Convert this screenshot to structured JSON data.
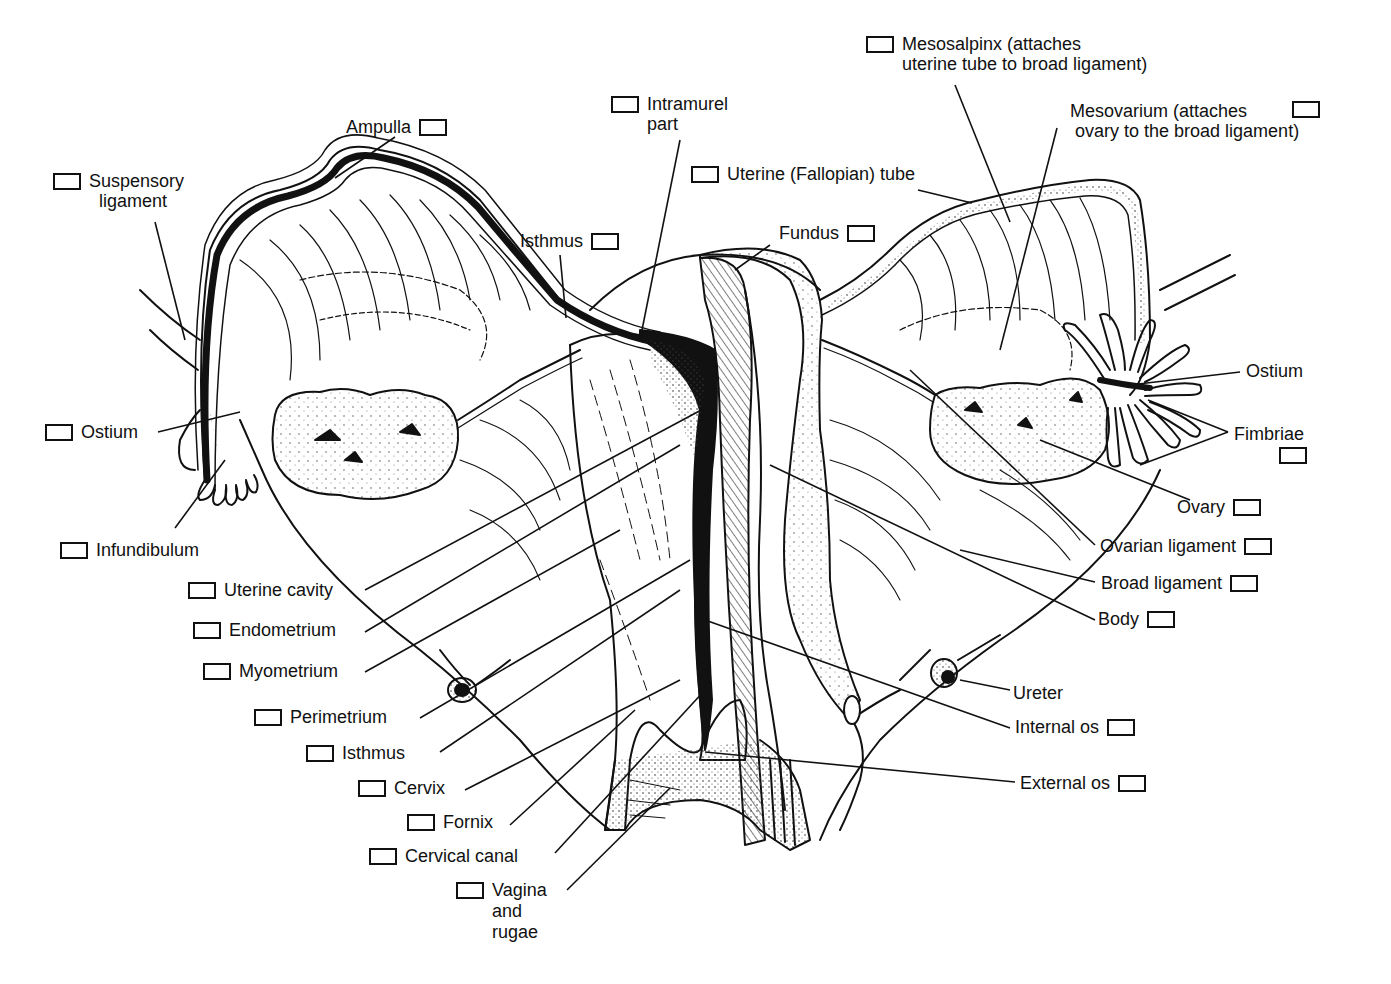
{
  "diagram": {
    "colors": {
      "ink": "#111111",
      "background": "#ffffff",
      "stipple": "#555555"
    },
    "labels": {
      "mesosalpinx": "Mesosalpinx (attaches\nuterine tube to broad ligament)",
      "mesovarium": "Mesovarium (attaches\n ovary to the broad ligament)",
      "intramural_part": "Intramurel\npart",
      "ampulla": "Ampulla",
      "suspensory_ligament": "Suspensory\n  ligament",
      "uterine_tube": "Uterine (Fallopian) tube",
      "isthmus_tube": "Isthmus",
      "fundus": "Fundus",
      "ostium_right": "Ostium",
      "ostium_left": "Ostium",
      "fimbriae": "Fimbriae",
      "ovary": "Ovary",
      "infundibulum": "Infundibulum",
      "ovarian_ligament": "Ovarian ligament",
      "uterine_cavity": "Uterine cavity",
      "broad_ligament": "Broad ligament",
      "endometrium": "Endometrium",
      "body": "Body",
      "myometrium": "Myometrium",
      "ureter": "Ureter",
      "perimetrium": "Perimetrium",
      "internal_os": "Internal os",
      "isthmus_uterus": "Isthmus",
      "cervix": "Cervix",
      "external_os": "External os",
      "fornix": "Fornix",
      "cervical_canal": "Cervical canal",
      "vagina_rugae": "Vagina\nand\nrugae"
    },
    "checkbox_count": 27,
    "unboxed_labels": [
      "Ostium (right)",
      "Ureter"
    ]
  }
}
